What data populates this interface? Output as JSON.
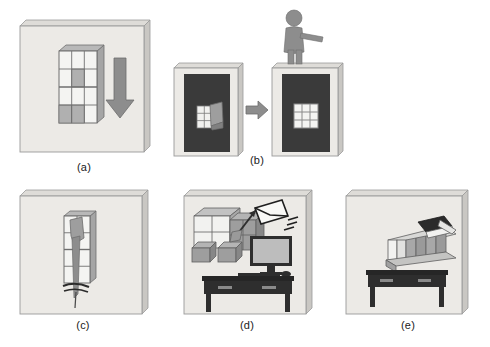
{
  "figure": {
    "type": "multi-panel-illustration",
    "panel_count": 5,
    "background_color": "#ffffff",
    "board_fill": "#eceae6",
    "board_edge": "#9a9a9a",
    "board_side": "#c9c7c3",
    "dark_fill": "#3a3a3a",
    "mid_gray": "#8d8d8d",
    "light_gray": "#c6c6c6",
    "cell_white": "#f4f4f2",
    "caption_color": "#1a1a1a"
  },
  "panels": [
    {
      "id": "a",
      "caption": "(a)",
      "description": "Flat board with a 3x4 shelf grid and a large downward arrow",
      "grid": {
        "cols": 3,
        "rows": 4,
        "filled_cells": [
          "r2c2",
          "r4c1",
          "r4c2"
        ]
      },
      "arrow": {
        "direction": "down",
        "color": "#8d8d8d"
      }
    },
    {
      "id": "b",
      "caption": "(b)",
      "description": "Two dark panels; left has a messy 3x3 window, right has a clean 3x3 window with a person standing on top",
      "left_board": {
        "window": "3x3",
        "state": "occluded"
      },
      "right_board": {
        "window": "3x3",
        "state": "clean"
      },
      "arrow": {
        "direction": "right",
        "color": "#8d8d8d"
      },
      "figure_person": {
        "pose": "arm-extended",
        "color": "#8d8d8d"
      }
    },
    {
      "id": "c",
      "caption": "(c)",
      "description": "Board with a 2x4 grid and a long downward arrow piercing through the grid",
      "grid": {
        "cols": 2,
        "rows": 4
      },
      "arrow": {
        "direction": "down-through",
        "color": "#8d8d8d"
      }
    },
    {
      "id": "d",
      "caption": "(d)",
      "description": "Board with an isometric cube grid with a pointing arrow, a flying envelope, a monitor and keyboard on a dark desk",
      "cubes": {
        "layout": "2x2 isometric"
      },
      "arrow": {
        "direction": "up-right",
        "color": "#3a3a3a"
      },
      "envelope": {
        "motion_lines": 3
      },
      "desk": {
        "drawers": 2,
        "color": "#2e2e2e"
      },
      "monitor": {
        "screen_color": "#bdbdbd"
      }
    },
    {
      "id": "e",
      "caption": "(e)",
      "description": "Board with an isometric shelf of books above a dark desk, one dark open book lying on top",
      "shelf": {
        "book_count": 6,
        "top_book": "dark-open"
      },
      "desk": {
        "drawers": 2,
        "color": "#2e2e2e"
      }
    }
  ],
  "captions": {
    "a": "(a)",
    "b": "(b)",
    "c": "(c)",
    "d": "(d)",
    "e": "(e)"
  }
}
